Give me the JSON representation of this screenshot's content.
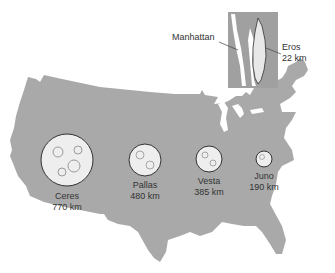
{
  "figure": {
    "map_fill": "#a9a9a9",
    "inset_fill": "#a0a0a0",
    "asteroid_fill": "#eeeeee",
    "asteroid_stroke": "#333333"
  },
  "inset": {
    "location_label": "Manhattan",
    "asteroid": {
      "name": "Eros",
      "size": "22 km"
    }
  },
  "asteroids": [
    {
      "name": "Ceres",
      "size": "770 km"
    },
    {
      "name": "Pallas",
      "size": "480 km"
    },
    {
      "name": "Vesta",
      "size": "385 km"
    },
    {
      "name": "Juno",
      "size": "190 km"
    }
  ]
}
